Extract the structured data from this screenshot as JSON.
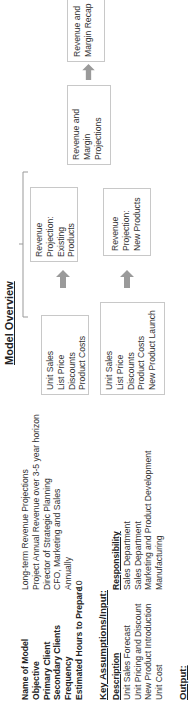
{
  "info": {
    "rows": [
      {
        "label": "Name of Model",
        "value": "Long-term Revenue Projections"
      },
      {
        "label": "Objective",
        "value": "Project Annual Revenue over 3-5 year horizon"
      },
      {
        "label": "Primary Client",
        "value": "Director of Strategic Planning"
      },
      {
        "label": "Secondary Clients",
        "value": "CFO, Marketing and Sales"
      },
      {
        "label": "Frequency",
        "value": "Annually"
      },
      {
        "label": "Estimated Hours to Prepare",
        "value": "10"
      }
    ]
  },
  "assumptions": {
    "title": "Key Assumptions/Input:",
    "col_description": "Description",
    "col_responsibility": "Responsibility",
    "rows": [
      {
        "description": "Unit Sales Forecast",
        "responsibility": "Sales Department"
      },
      {
        "description": "Unit Pricing and Discount",
        "responsibility": "Sales Department"
      },
      {
        "description": "New Product Introduction",
        "responsibility": "Marketing and Product Development"
      },
      {
        "description": "Unit Cost",
        "responsibility": "Manufacturing"
      }
    ]
  },
  "output": {
    "title": "Output:"
  },
  "overview": {
    "title": "Model Overview",
    "input_existing": [
      "Unit Sales",
      "List Price",
      "Discounts",
      "Product Costs"
    ],
    "input_new": [
      "Unit Sales",
      "List Price",
      "Discounts",
      "Product Costs",
      "New Product Launch"
    ],
    "proj_existing": [
      "Revenue",
      "Projection:",
      "Existing",
      "Products"
    ],
    "proj_new": [
      "Revenue",
      "Projection:",
      "New Products"
    ],
    "margin_proj": [
      "Revenue and",
      "Margin",
      "Projections"
    ],
    "recap": [
      "Revenue and",
      "Margin Recap"
    ]
  },
  "colors": {
    "arrow": "#9a9a9a",
    "box_border": "#c8c8c8"
  }
}
